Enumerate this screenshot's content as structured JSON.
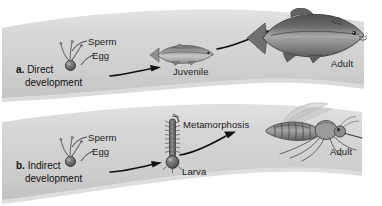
{
  "figure": {
    "background_color": "#ffffff",
    "band_color": "#d2d2d2",
    "band_color_light": "#dedede",
    "band_shadow_color": "#bfbfbf",
    "label_color": "#1a1a1a"
  },
  "panels": [
    {
      "id": "panel-a",
      "letter": "a.",
      "caption_line1": "Direct",
      "caption_line2": "development",
      "stages": [
        {
          "name": "sperm",
          "label": "Sperm"
        },
        {
          "name": "egg",
          "label": "Egg"
        },
        {
          "name": "juvenile",
          "label": "Juvenile"
        },
        {
          "name": "adult",
          "label": "Adult"
        }
      ],
      "organism": "salmon"
    },
    {
      "id": "panel-b",
      "letter": "b.",
      "caption_line1": "Indirect",
      "caption_line2": "development",
      "stages": [
        {
          "name": "sperm",
          "label": "Sperm"
        },
        {
          "name": "egg",
          "label": "Egg"
        },
        {
          "name": "larva",
          "label": "Larva"
        },
        {
          "name": "metamorphosis",
          "label": "Metamorphosis"
        },
        {
          "name": "adult",
          "label": "Adult"
        }
      ],
      "organism": "mosquito"
    }
  ]
}
